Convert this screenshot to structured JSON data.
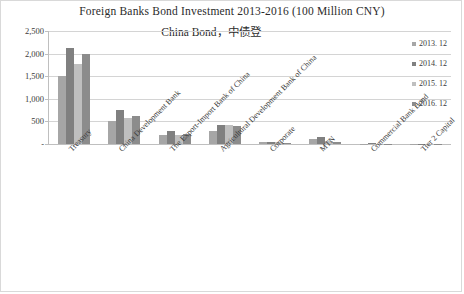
{
  "chart_data": {
    "type": "bar",
    "title": "Foreign Banks Bond Investment 2013-2016 (100 Million CNY)",
    "subtitle": "China Bond，中债登",
    "xlabel": "",
    "ylabel": "",
    "ylim": [
      0,
      2500
    ],
    "ytick_labels": [
      "2,500",
      "2,000",
      "1,500",
      "1,000",
      "500",
      "-"
    ],
    "ytick_values": [
      2500,
      2000,
      1500,
      1000,
      500,
      0
    ],
    "grid": true,
    "legend_position": "right",
    "categories": [
      "Treasury",
      "China Development Bank",
      "The Export-Import Bank of China",
      "Agricultural Development Bank of China",
      "Corporate",
      "MTN",
      "Commercial Bank Bond",
      "Tier 2 Capital"
    ],
    "series": [
      {
        "name": "2013. 12",
        "color": "#a6a6a6",
        "values": [
          1500,
          500,
          200,
          280,
          40,
          110,
          10,
          5
        ]
      },
      {
        "name": "2014. 12",
        "color": "#808080",
        "values": [
          2120,
          750,
          280,
          410,
          45,
          160,
          12,
          6
        ]
      },
      {
        "name": "2015. 12",
        "color": "#bfbfbf",
        "values": [
          1760,
          580,
          210,
          420,
          35,
          60,
          8,
          5
        ]
      },
      {
        "name": "2016. 12",
        "color": "#8c8c8c",
        "values": [
          1990,
          620,
          215,
          390,
          30,
          55,
          10,
          6
        ]
      }
    ]
  }
}
